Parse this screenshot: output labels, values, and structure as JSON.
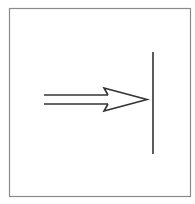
{
  "diagram": {
    "colors": {
      "background": "#ffffff",
      "frame": "#8a8a8a",
      "stroke": "#333333"
    },
    "elements": [
      {
        "name": "frame",
        "type": "rect"
      },
      {
        "name": "arrow",
        "type": "hollow-double-arrow",
        "direction": "right"
      },
      {
        "name": "barrier",
        "type": "vertical-line"
      }
    ]
  }
}
